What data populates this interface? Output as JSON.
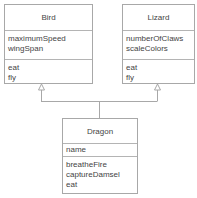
{
  "diagram": {
    "type": "uml-class-diagram",
    "classes": {
      "bird": {
        "name": "Bird",
        "attributes": [
          "maximumSpeed",
          "wingSpan"
        ],
        "operations": [
          "eat",
          "fly"
        ]
      },
      "lizard": {
        "name": "Lizard",
        "attributes": [
          "numberOfClaws",
          "scaleColors"
        ],
        "operations": [
          "eat",
          "fly"
        ]
      },
      "dragon": {
        "name": "Dragon",
        "attributes": [
          "name"
        ],
        "operations": [
          "breatheFire",
          "captureDamsel",
          "eat"
        ]
      }
    },
    "relationships": [
      {
        "type": "generalization",
        "from": "Dragon",
        "to": "Bird"
      },
      {
        "type": "generalization",
        "from": "Dragon",
        "to": "Lizard"
      }
    ],
    "colors": {
      "border": "#a8a8a8",
      "text": "#444444",
      "background": "#ffffff"
    }
  }
}
